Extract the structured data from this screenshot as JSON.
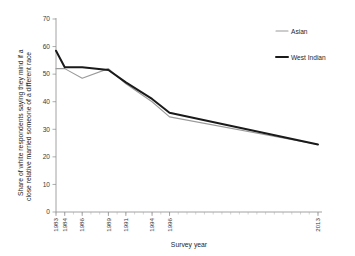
{
  "chart_data": {
    "type": "line",
    "title": "",
    "subtitle": "",
    "xlabel": "Survey year",
    "ylabel": "Share of white respondents saying they mind if a close relative married someone of a different race",
    "x": [
      1983,
      1984,
      1986,
      1989,
      1991,
      1994,
      1996,
      2013
    ],
    "xtick_labels": [
      "1983",
      "1984",
      "1986",
      "1989",
      "1991",
      "1994",
      "1996",
      "2013"
    ],
    "xlim": [
      1983,
      2013
    ],
    "ylim": [
      0,
      70
    ],
    "ytick_labels": [
      "0",
      "10",
      "20",
      "30",
      "40",
      "50",
      "60",
      "70"
    ],
    "ytick_values": [
      0,
      10,
      20,
      30,
      40,
      50,
      60,
      70
    ],
    "grid": false,
    "legend_position": "top-right",
    "series": [
      {
        "name": "Asian",
        "color": "#9a9a9a",
        "width": 1.1,
        "values": [
          52,
          52,
          48.5,
          52,
          46.5,
          40,
          34.5,
          24.5
        ]
      },
      {
        "name": "West Indian",
        "color": "#1a1a1a",
        "width": 2.0,
        "values": [
          58.5,
          52.5,
          52.5,
          51.5,
          47,
          41,
          36,
          24.5
        ]
      }
    ]
  },
  "legend": {
    "items": [
      {
        "label": "Asian"
      },
      {
        "label": "West Indian"
      }
    ]
  },
  "axes": {
    "x_title": "Survey year",
    "y_title_line1": "Share of white respondents saying they mind if a",
    "y_title_line2": "close relative married someone of a different race"
  }
}
